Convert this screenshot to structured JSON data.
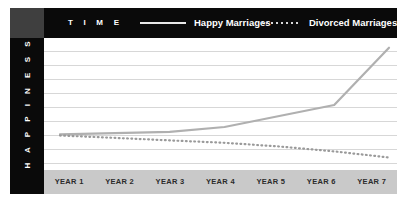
{
  "header": {
    "brand": "T I M E",
    "legend": [
      {
        "label": "Happy Marriages",
        "style": "solid",
        "color": "#b0b0b0"
      },
      {
        "label": "Divorced Marriages",
        "style": "dotted",
        "color": "#9a9a9a"
      }
    ]
  },
  "axes": {
    "y_title": "H A P P I N E S S",
    "x_ticks": [
      "YEAR 1",
      "YEAR 2",
      "YEAR 3",
      "YEAR 4",
      "YEAR 5",
      "YEAR 6",
      "YEAR 7"
    ]
  },
  "colors": {
    "header_background": "#0a0a0a",
    "corner_block": "#3f3f3f",
    "sidebar": "#0a0a0a",
    "plot_background": "#ffffff",
    "gridline": "#d7d7d7",
    "xaxis_band": "#c9c9c9",
    "happy_line": "#b0b0b0",
    "divorced_line": "#9a9a9a",
    "legend_text": "#ffffff",
    "xtick_text": "#2b2b2b"
  },
  "chart_data": {
    "type": "line",
    "title": "T I M E",
    "xlabel": "",
    "ylabel": "HAPPINESS",
    "categories": [
      "YEAR 1",
      "YEAR 2",
      "YEAR 3",
      "YEAR 4",
      "YEAR 5",
      "YEAR 6",
      "YEAR 7"
    ],
    "ylim": [
      0,
      100
    ],
    "xlim": [
      1,
      7
    ],
    "grid": true,
    "gridline_count": 9,
    "legend_position": "top",
    "series": [
      {
        "name": "Happy Marriages",
        "style": "solid",
        "color": "#b0b0b0",
        "values": [
          26,
          27,
          28,
          32,
          41,
          50,
          97
        ]
      },
      {
        "name": "Divorced Marriages",
        "style": "dotted",
        "color": "#9a9a9a",
        "values": [
          25,
          23,
          21,
          19,
          16,
          12,
          7
        ]
      }
    ]
  }
}
